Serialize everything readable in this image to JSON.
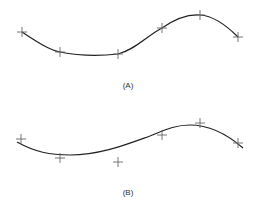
{
  "figure": {
    "panels": [
      {
        "label": "(A)",
        "description": "Interpolating curve passing through all points",
        "points": [
          [
            22,
            32
          ],
          [
            60,
            52
          ],
          [
            118,
            54
          ],
          [
            162,
            28
          ],
          [
            200,
            15
          ],
          [
            238,
            37
          ]
        ],
        "curve_path": "M22,32 C40,44 50,50 60,52 C80,56 100,56 118,54 C135,50 148,35 162,28 C175,19 188,14 200,15 C215,16 228,27 238,37",
        "label_pos": [
          128,
          81
        ]
      },
      {
        "label": "(B)",
        "description": "Approximating (smoothing) curve near the points",
        "points": [
          [
            21,
            139
          ],
          [
            60,
            158
          ],
          [
            118,
            162
          ],
          [
            162,
            135
          ],
          [
            200,
            123
          ],
          [
            238,
            143
          ]
        ],
        "curve_path": "M17,142 C35,152 50,155 70,155 C100,155 125,145 150,136 C165,130 175,125 190,125 C210,125 228,135 243,148",
        "label_pos": [
          128,
          188
        ]
      }
    ],
    "colors": {
      "curve": "#222222",
      "marker": "#666666"
    }
  }
}
